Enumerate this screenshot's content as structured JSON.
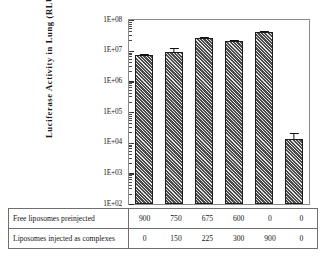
{
  "chart_data": {
    "type": "bar",
    "title": "",
    "xlabel": "",
    "ylabel": "Luciferase Activity in Lung (RLU/mg)",
    "yscale": "log",
    "ylim": [
      100,
      100000000
    ],
    "ytick_labels": [
      "1E+08",
      "1E+07",
      "1E+06",
      "1E+05",
      "1E+04",
      "1E+03",
      "1E+02"
    ],
    "ytick_values": [
      100000000,
      10000000,
      1000000,
      100000,
      10000,
      1000,
      100
    ],
    "grid": false,
    "legend": null,
    "categories": [
      "1",
      "2",
      "3",
      "4",
      "5",
      "6"
    ],
    "values": [
      7000000,
      8800000,
      2500000,
      21000000,
      40000000,
      13000
    ],
    "bar_values": [
      7000000,
      8800000,
      25000000,
      21000000,
      40000000,
      13000
    ],
    "error_high": [
      8200000,
      13000000,
      31000000,
      24000000,
      48000000,
      22000
    ],
    "bar_fill": "#4a4a4a",
    "bar_hatch": "diagonal",
    "axis_color": "#8a8a8a"
  },
  "table": {
    "rows": [
      {
        "label": "Free liposomes preinjected",
        "cells": [
          "900",
          "750",
          "675",
          "600",
          "0",
          "0"
        ]
      },
      {
        "label": "Liposomes injected as complexes",
        "cells": [
          "0",
          "150",
          "225",
          "300",
          "900",
          "0"
        ]
      }
    ]
  }
}
